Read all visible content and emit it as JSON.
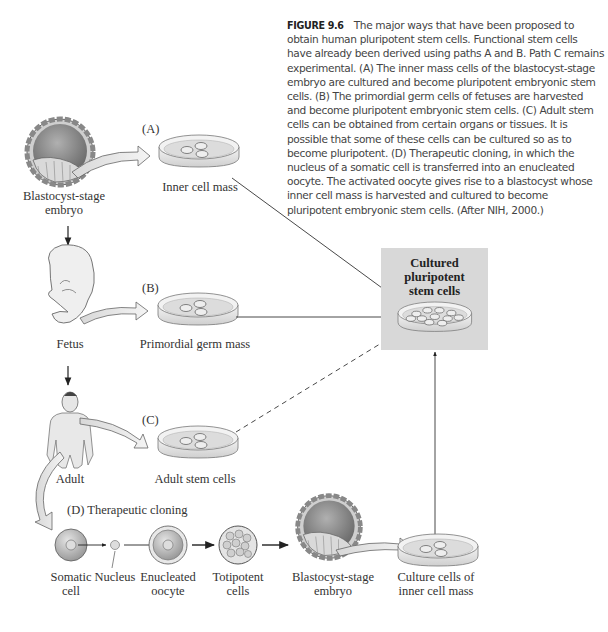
{
  "figure": {
    "label": "FIGURE 9.6",
    "caption": "The major ways that have been proposed to obtain human pluripotent stem cells. Functional stem cells have already been derived using paths A and B. Path C remains experimental. (A) The inner mass cells of the blastocyst-stage embryo are cultured and become pluripotent embryonic stem cells. (B) The primordial germ cells of fetuses are harvested and become pluripotent embryonic stem cells. (C) Adult stem cells can be obtained from certain organs or tissues. It is possible that some of these cells can be cultured so as to become pluripotent. (D) Therapeutic cloning, in which the nucleus of a somatic cell is transferred into an enucleated oocyte. The activated oocyte gives rise to a blastocyst whose inner cell mass is harvested and cultured to become pluripotent embryonic stem cells. (After NIH, 2000.)"
  },
  "target": {
    "title_line1": "Cultured",
    "title_line2": "pluripotent",
    "title_line3": "stem cells",
    "box_color": "#d8d8d8"
  },
  "sources": {
    "blastocyst_line1": "Blastocyst-stage",
    "blastocyst_line2": "embryo",
    "fetus": "Fetus",
    "adult": "Adult"
  },
  "paths": {
    "a": {
      "letter": "(A)",
      "dish_label": "Inner cell mass"
    },
    "b": {
      "letter": "(B)",
      "dish_label": "Primordial germ mass"
    },
    "c": {
      "letter": "(C)",
      "dish_label": "Adult stem cells"
    },
    "d": {
      "title": "(D)  Therapeutic cloning",
      "steps": {
        "somatic_line1": "Somatic",
        "somatic_line2": "cell",
        "nucleus": "Nucleus",
        "enucleated_line1": "Enucleated",
        "enucleated_line2": "oocyte",
        "totipotent_line1": "Totipotent",
        "totipotent_line2": "cells",
        "blastocyst_line1": "Blastocyst-stage",
        "blastocyst_line2": "embryo",
        "culture_line1": "Culture cells of",
        "culture_line2": "inner cell mass"
      }
    }
  }
}
